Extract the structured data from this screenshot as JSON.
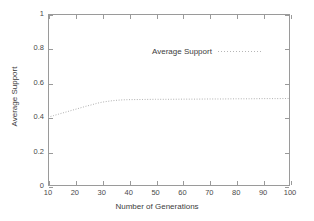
{
  "chart_data": {
    "type": "line",
    "title": "",
    "xlabel": "Number of Generations",
    "ylabel": "Average Support",
    "xlim": [
      10,
      100
    ],
    "ylim": [
      0,
      1
    ],
    "xticks": [
      10,
      20,
      30,
      40,
      50,
      60,
      70,
      80,
      90,
      100
    ],
    "xtick_labels": [
      "10",
      "20",
      "30",
      "40",
      "50",
      "60",
      "70",
      "80",
      "90",
      "100"
    ],
    "yticks": [
      0,
      0.2,
      0.4,
      0.6,
      0.8,
      1
    ],
    "ytick_labels": [
      "0",
      "0.2",
      "0.4",
      "0.6",
      "0.8",
      "1"
    ],
    "grid": false,
    "legend_position": "top-center",
    "series": [
      {
        "name": "Average Support",
        "style": "dotted",
        "color": "#b0b0b0",
        "x": [
          10,
          12,
          14,
          16,
          18,
          20,
          22,
          24,
          26,
          28,
          30,
          32,
          34,
          36,
          38,
          40,
          45,
          50,
          55,
          60,
          65,
          70,
          75,
          80,
          85,
          90,
          95,
          100
        ],
        "values": [
          0.4,
          0.409,
          0.418,
          0.427,
          0.436,
          0.445,
          0.454,
          0.463,
          0.471,
          0.48,
          0.487,
          0.492,
          0.496,
          0.499,
          0.501,
          0.502,
          0.503,
          0.504,
          0.504,
          0.505,
          0.505,
          0.506,
          0.506,
          0.507,
          0.507,
          0.508,
          0.508,
          0.509
        ]
      }
    ]
  },
  "legend": {
    "entries": [
      {
        "label": "Average Support"
      }
    ]
  },
  "axes": {
    "x_title": "Number of Generations",
    "y_title": "Average Support"
  }
}
